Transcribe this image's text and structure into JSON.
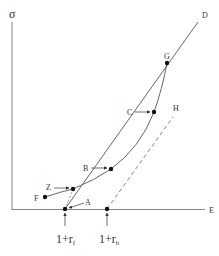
{
  "diagram": {
    "axes": {
      "y_label": "σ",
      "x_label": "E"
    },
    "points": {
      "D": "D",
      "G": "G",
      "C": "C",
      "H": "H",
      "B": "B",
      "Z": "Z",
      "F": "F",
      "A": "A"
    },
    "axis_markers": {
      "rf": "1+r",
      "rf_sub": "f",
      "rb": "1+r",
      "rb_sub": "b"
    },
    "colors": {
      "line": "#555555",
      "dot": "#111111",
      "background": "#ffffff"
    }
  }
}
